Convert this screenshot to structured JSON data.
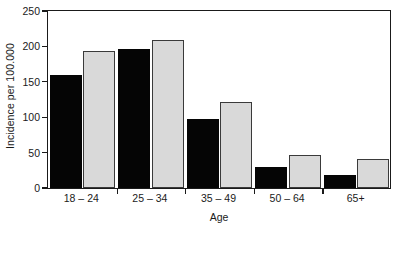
{
  "chart_data": {
    "type": "bar",
    "title": "",
    "xlabel": "Age",
    "ylabel": "Incidence per 100.000",
    "categories": [
      "18 – 24",
      "25 – 34",
      "35 – 49",
      "50 – 64",
      "65+"
    ],
    "series": [
      {
        "name": "series-1",
        "color": "#050505",
        "values": [
          160,
          197,
          97,
          29,
          18
        ]
      },
      {
        "name": "series-2",
        "color": "#d9d9d9",
        "values": [
          194,
          209,
          121,
          47,
          41
        ]
      }
    ],
    "ylim": [
      0,
      250
    ],
    "yticks": [
      0,
      50,
      100,
      150,
      200,
      250
    ],
    "ytick_labels": [
      "0",
      "50",
      "100",
      "150",
      "200",
      "250"
    ],
    "grid": false,
    "legend": "none",
    "axis_color": "#1a1a1a",
    "background": "#ffffff"
  }
}
